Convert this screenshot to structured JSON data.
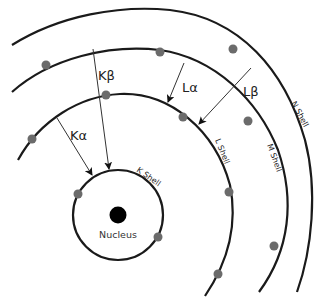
{
  "diagram": {
    "nucleus": {
      "label": "Nucleus"
    },
    "shells": [
      {
        "id": "K",
        "label": "K Shell"
      },
      {
        "id": "L",
        "label": "L Shell"
      },
      {
        "id": "M",
        "label": "M Shell"
      },
      {
        "id": "N",
        "label": "N Shell"
      }
    ],
    "transitions": [
      {
        "id": "Ka",
        "label": "Kα",
        "from": "L",
        "to": "K"
      },
      {
        "id": "Kb",
        "label": "Kβ",
        "from": "M",
        "to": "K"
      },
      {
        "id": "La",
        "label": "Lα",
        "from": "M",
        "to": "L"
      },
      {
        "id": "Lb",
        "label": "Lβ",
        "from": "N",
        "to": "L"
      }
    ],
    "colors": {
      "shell": "#1a1a1a",
      "electron": "#6b6b6b",
      "nucleus": "#000000"
    }
  }
}
